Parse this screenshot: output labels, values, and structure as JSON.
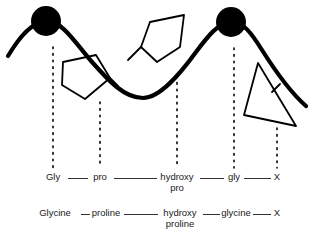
{
  "figure": {
    "title_alt": "Collagen triple-helix repeating sequence diagram",
    "background_color": "#ffffff",
    "ink_color": "#000000",
    "text_color": "#1a1a1a",
    "backbone": {
      "name": "polypeptide-backbone",
      "stroke_width": 4.2,
      "path": "M 8 56 C 20 36, 32 22, 46 21 C 62 20, 76 44, 92 62 C 108 80, 124 98, 143 98 C 160 98, 180 74, 196 52 C 208 36, 218 23, 231 22 C 243 21, 252 34, 262 50 C 274 69, 290 92, 306 106"
    },
    "residue_circles": [
      {
        "name": "glycine-circle-left",
        "cx": 46,
        "cy": 21,
        "r": 15,
        "label": "Gly"
      },
      {
        "name": "glycine-circle-right",
        "cx": 231,
        "cy": 22,
        "r": 15,
        "label": "gly"
      }
    ],
    "side_groups": [
      {
        "name": "proline-ring",
        "shape": "pentagon",
        "points": "63,62 96,55 110,78 85,99 62,85"
      },
      {
        "name": "proline-ring-bond",
        "shape": "line",
        "points": "110,78 118,86"
      },
      {
        "name": "hydroxyproline-ring",
        "shape": "pentagon",
        "points": "150,22 184,15 180,47 157,62 141,47"
      },
      {
        "name": "hydroxyproline-ring-bond",
        "shape": "line",
        "points": "141,47 128,60"
      },
      {
        "name": "x-residue-triangle",
        "shape": "triangle",
        "points": "258,63 244,115 296,126"
      },
      {
        "name": "x-residue-tick",
        "shape": "line",
        "points": "272,92 280,84"
      }
    ],
    "dotted_connectors": [
      {
        "name": "dotted-connector-gly",
        "x": 53,
        "y1": 47,
        "y2": 168
      },
      {
        "name": "dotted-connector-pro",
        "x": 100,
        "y1": 102,
        "y2": 168
      },
      {
        "name": "dotted-connector-hydroxypro",
        "x": 177,
        "y1": 76,
        "y2": 168
      },
      {
        "name": "dotted-connector-gly2",
        "x": 234,
        "y1": 48,
        "y2": 168
      },
      {
        "name": "dotted-connector-x",
        "x": 277,
        "y1": 128,
        "y2": 168
      }
    ]
  },
  "sequence_abbrev": {
    "name": "abbreviated-sequence",
    "residues": [
      {
        "label": "Gly",
        "sub": "",
        "x": 53
      },
      {
        "label": "pro",
        "sub": "",
        "x": 100
      },
      {
        "label": "hydroxy",
        "sub": "pro",
        "x": 177
      },
      {
        "label": "gly",
        "sub": "",
        "x": 234
      },
      {
        "label": "X",
        "sub": "",
        "x": 277
      }
    ],
    "bonds": [
      {
        "x1": 68,
        "x2": 88
      },
      {
        "x1": 114,
        "x2": 157
      },
      {
        "x1": 200,
        "x2": 224
      },
      {
        "x1": 244,
        "x2": 271
      }
    ]
  },
  "sequence_full": {
    "name": "full-name-sequence",
    "residues": [
      {
        "label": "Glycine",
        "sub": "",
        "x": 55
      },
      {
        "label": "proline",
        "sub": "",
        "x": 106
      },
      {
        "label": "hydroxy",
        "sub": "proline",
        "x": 180
      },
      {
        "label": "glycine",
        "sub": "",
        "x": 236
      },
      {
        "label": "X",
        "sub": "",
        "x": 277
      }
    ],
    "bonds": [
      {
        "x1": 81,
        "x2": 90
      },
      {
        "x1": 124,
        "x2": 158
      },
      {
        "x1": 203,
        "x2": 220
      },
      {
        "x1": 253,
        "x2": 271
      }
    ]
  }
}
